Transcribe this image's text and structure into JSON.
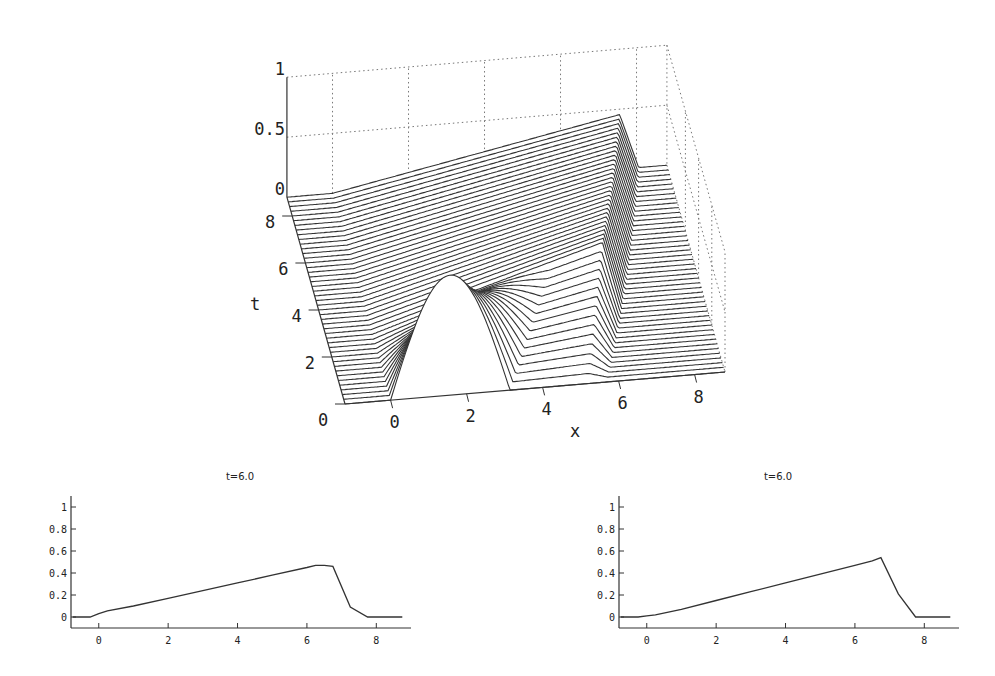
{
  "chart_data": [
    {
      "type": "surface-waterfall",
      "title": "",
      "xlabel": "x",
      "ylabel": "t",
      "zlabel": "",
      "x_ticks": [
        "0",
        "2",
        "4",
        "6",
        "8"
      ],
      "t_ticks": [
        "0",
        "2",
        "4",
        "6",
        "8"
      ],
      "z_ticks": [
        "0",
        "0.5",
        "1"
      ],
      "xlim": [
        -1.2,
        8.8
      ],
      "tlim": [
        0,
        8.8
      ],
      "zlim": [
        0,
        1
      ],
      "grid": "dotted back planes",
      "num_slices": 45,
      "initial_condition": "sine hump on [0, 3.14], peak 1.0 at x=1.57",
      "evolution": "hump steepens into a right-moving triangular (sawtooth) wave; shock at x≈6.9 with height ≈0.5 at t=6"
    },
    {
      "type": "line",
      "title": "t=6.0",
      "xlabel": "",
      "ylabel": "",
      "x_ticks": [
        "0",
        "2",
        "4",
        "6",
        "8"
      ],
      "y_ticks": [
        "0",
        "0.2",
        "0.4",
        "0.6",
        "0.8",
        "1"
      ],
      "xlim": [
        -0.8,
        9.0
      ],
      "ylim": [
        -0.1,
        1.1
      ],
      "grid": false,
      "x": [
        -0.75,
        -0.25,
        0.0,
        0.25,
        1,
        2,
        3,
        4,
        5,
        6,
        6.25,
        6.5,
        6.75,
        7.25,
        7.75,
        8.75
      ],
      "y": [
        0,
        0,
        0.03,
        0.055,
        0.1,
        0.17,
        0.24,
        0.31,
        0.38,
        0.45,
        0.47,
        0.47,
        0.46,
        0.09,
        0,
        0
      ]
    },
    {
      "type": "line",
      "title": "t=6.0",
      "xlabel": "",
      "ylabel": "",
      "x_ticks": [
        "0",
        "2",
        "4",
        "6",
        "8"
      ],
      "y_ticks": [
        "0",
        "0.2",
        "0.4",
        "0.6",
        "0.8",
        "1"
      ],
      "xlim": [
        -0.8,
        9.0
      ],
      "ylim": [
        -0.1,
        1.1
      ],
      "grid": false,
      "x": [
        -0.75,
        -0.25,
        0.0,
        0.25,
        1,
        2,
        3,
        4,
        5,
        6,
        6.5,
        6.75,
        7.25,
        7.75,
        8.75
      ],
      "y": [
        0,
        0,
        0.01,
        0.02,
        0.07,
        0.15,
        0.23,
        0.31,
        0.39,
        0.47,
        0.51,
        0.54,
        0.21,
        0,
        0
      ]
    }
  ]
}
